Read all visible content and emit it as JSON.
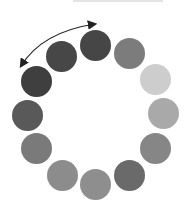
{
  "diagram": {
    "type": "circular-dot-loading-indicator",
    "dot_count": 12,
    "dots": [
      {
        "x": 95,
        "y": 45,
        "color": "#464646"
      },
      {
        "x": 129,
        "y": 53,
        "color": "#7c7c7c"
      },
      {
        "x": 155,
        "y": 79,
        "color": "#cdcdcd"
      },
      {
        "x": 163,
        "y": 113,
        "color": "#a9a9a9"
      },
      {
        "x": 155,
        "y": 148,
        "color": "#868686"
      },
      {
        "x": 129,
        "y": 175,
        "color": "#6a6a6a"
      },
      {
        "x": 95,
        "y": 184,
        "color": "#8e8e8e"
      },
      {
        "x": 62,
        "y": 175,
        "color": "#8c8c8c"
      },
      {
        "x": 36,
        "y": 148,
        "color": "#7a7a7a"
      },
      {
        "x": 27,
        "y": 115,
        "color": "#595959"
      },
      {
        "x": 36,
        "y": 81,
        "color": "#3f3f3f"
      },
      {
        "x": 61,
        "y": 56,
        "color": "#474747"
      }
    ],
    "arrow": {
      "description": "double-headed curved arrow over top-left dots",
      "color": "#222222"
    }
  }
}
